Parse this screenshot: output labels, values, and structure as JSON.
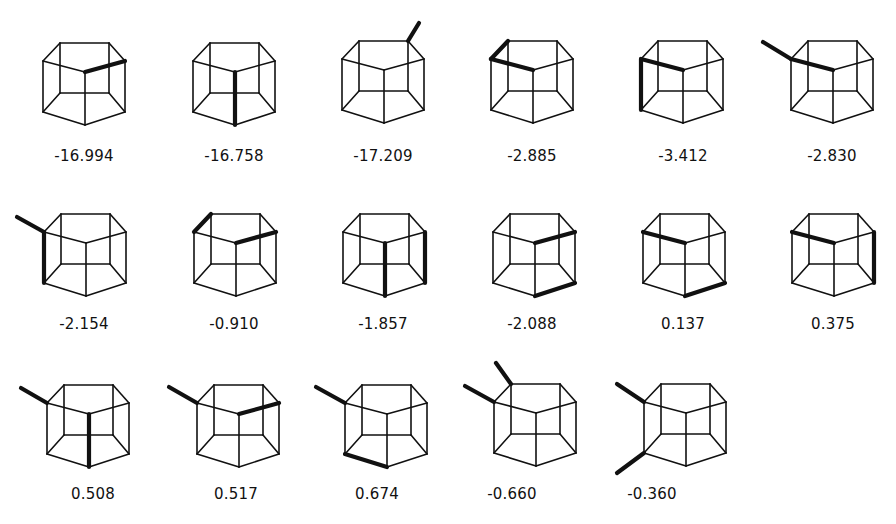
{
  "figure": {
    "vertex_model": {
      "LT": [
        0,
        0
      ],
      "BL": [
        17,
        -18
      ],
      "BR": [
        66,
        -18
      ],
      "RT": [
        82,
        0
      ],
      "FT": [
        42,
        11
      ],
      "LB": [
        0,
        51
      ],
      "FB": [
        42,
        64
      ],
      "RB": [
        82,
        51
      ],
      "IL": [
        17,
        32
      ],
      "IR": [
        66,
        32
      ]
    },
    "edges": [
      [
        "LT",
        "BL"
      ],
      [
        "BL",
        "BR"
      ],
      [
        "BR",
        "RT"
      ],
      [
        "RT",
        "FT"
      ],
      [
        "FT",
        "LT"
      ],
      [
        "LB",
        "FB"
      ],
      [
        "FB",
        "RB"
      ],
      [
        "RB",
        "IR"
      ],
      [
        "IR",
        "IL"
      ],
      [
        "IL",
        "LB"
      ],
      [
        "LT",
        "LB"
      ],
      [
        "FT",
        "FB"
      ],
      [
        "RT",
        "RB"
      ],
      [
        "BL",
        "IL"
      ],
      [
        "BR",
        "IR"
      ]
    ],
    "molecules": [
      {
        "row": 1,
        "col": 1,
        "origin": [
          43,
          61
        ],
        "label": "-16.994",
        "bold": [
          [
            "FT",
            "RT"
          ]
        ],
        "subs": []
      },
      {
        "row": 1,
        "col": 2,
        "origin": [
          193,
          61
        ],
        "label": "-16.758",
        "bold": [
          [
            "FT",
            "FB"
          ]
        ],
        "subs": []
      },
      {
        "row": 1,
        "col": 3,
        "origin": [
          342,
          59
        ],
        "label": "-17.209",
        "bold": [],
        "subs": [
          {
            "from": "BR",
            "dx": 11,
            "dy": -18
          }
        ]
      },
      {
        "row": 1,
        "col": 4,
        "origin": [
          491,
          59
        ],
        "label": "-2.885",
        "bold": [
          [
            "LT",
            "BL"
          ],
          [
            "LT",
            "FT"
          ]
        ],
        "subs": []
      },
      {
        "row": 1,
        "col": 5,
        "origin": [
          641,
          59
        ],
        "label": "-3.412",
        "bold": [
          [
            "LT",
            "FT"
          ],
          [
            "LT",
            "LB"
          ]
        ],
        "subs": []
      },
      {
        "row": 1,
        "col": 6,
        "origin": [
          791,
          59
        ],
        "label": "-2.830",
        "bold": [
          [
            "LT",
            "FT"
          ]
        ],
        "subs": [
          {
            "from": "LT",
            "dx": -28,
            "dy": -17
          }
        ]
      },
      {
        "row": 2,
        "col": 1,
        "origin": [
          44,
          232
        ],
        "label": "-2.154",
        "bold": [
          [
            "LT",
            "LB"
          ]
        ],
        "subs": [
          {
            "from": "LT",
            "dx": -27,
            "dy": -15
          }
        ]
      },
      {
        "row": 2,
        "col": 2,
        "origin": [
          194,
          232
        ],
        "label": "-0.910",
        "bold": [
          [
            "LT",
            "BL"
          ],
          [
            "FT",
            "RT"
          ]
        ],
        "subs": []
      },
      {
        "row": 2,
        "col": 3,
        "origin": [
          343,
          232
        ],
        "label": "-1.857",
        "bold": [
          [
            "FT",
            "FB"
          ],
          [
            "RT",
            "RB"
          ]
        ],
        "subs": []
      },
      {
        "row": 2,
        "col": 4,
        "origin": [
          493,
          232
        ],
        "label": "-2.088",
        "bold": [
          [
            "FT",
            "RT"
          ],
          [
            "FB",
            "RB"
          ]
        ],
        "subs": []
      },
      {
        "row": 2,
        "col": 5,
        "origin": [
          643,
          232
        ],
        "label": "0.137",
        "bold": [
          [
            "LT",
            "FT"
          ],
          [
            "FB",
            "RB"
          ]
        ],
        "subs": []
      },
      {
        "row": 2,
        "col": 6,
        "origin": [
          792,
          232
        ],
        "label": "0.375",
        "bold": [
          [
            "LT",
            "FT"
          ],
          [
            "RT",
            "RB"
          ]
        ],
        "subs": []
      },
      {
        "row": 3,
        "col": 1,
        "origin": [
          47,
          403
        ],
        "label": "0.508",
        "bold": [
          [
            "FT",
            "FB"
          ]
        ],
        "subs": [
          {
            "from": "LT",
            "dx": -26,
            "dy": -15
          }
        ]
      },
      {
        "row": 3,
        "col": 2,
        "origin": [
          197,
          403
        ],
        "label": "0.517",
        "bold": [
          [
            "FT",
            "RT"
          ]
        ],
        "subs": [
          {
            "from": "LT",
            "dx": -28,
            "dy": -16
          }
        ]
      },
      {
        "row": 3,
        "col": 3,
        "origin": [
          345,
          403
        ],
        "label": "0.674",
        "bold": [
          [
            "LB",
            "FB"
          ]
        ],
        "subs": [
          {
            "from": "LT",
            "dx": -29,
            "dy": -16
          }
        ]
      },
      {
        "row": 3,
        "col": 4,
        "origin": [
          494,
          402
        ],
        "label": "-0.660",
        "bold": [],
        "subs": [
          {
            "from": "LT",
            "dx": -29,
            "dy": -16
          },
          {
            "from": "BL",
            "dx": -15,
            "dy": -21
          }
        ]
      },
      {
        "row": 3,
        "col": 5,
        "origin": [
          644,
          402
        ],
        "label": "-0.360",
        "bold": [],
        "subs": [
          {
            "from": "LT",
            "dx": -27,
            "dy": -18
          },
          {
            "from": "LB",
            "dx": -27,
            "dy": 20
          }
        ]
      }
    ],
    "label_positions": [
      [
        84,
        150
      ],
      [
        234,
        150
      ],
      [
        383,
        150
      ],
      [
        532,
        150
      ],
      [
        683,
        150
      ],
      [
        832,
        150
      ],
      [
        84,
        318
      ],
      [
        234,
        318
      ],
      [
        383,
        318
      ],
      [
        532,
        318
      ],
      [
        683,
        318
      ],
      [
        833,
        318
      ],
      [
        93,
        488
      ],
      [
        236,
        488
      ],
      [
        377,
        488
      ],
      [
        512,
        488
      ],
      [
        652,
        488
      ]
    ]
  }
}
